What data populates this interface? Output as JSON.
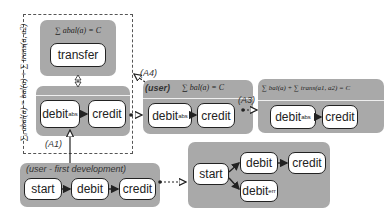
{
  "diagram": {
    "left_group": {
      "side_formula": "∑ₐ abal(a) = bal(a) + ∑ trans(a, a2)",
      "top_panel": {
        "formula": "∑ abal(a) = C",
        "node": "transfer"
      },
      "bottom_panel": {
        "nodes": [
          {
            "label": "debit",
            "sub": "abs"
          },
          {
            "label": "credit",
            "sub": ""
          }
        ]
      },
      "arrow_label": "(A1)"
    },
    "user_first_dev": {
      "title": "(user - first development)",
      "nodes": [
        "start",
        "debit",
        "credit"
      ]
    },
    "a2": {
      "label": "(A2)",
      "nodes": {
        "start": "start",
        "debit": "debit",
        "credit": "credit",
        "debit_err": "debit",
        "debit_err_sub": "err"
      }
    },
    "user": {
      "arrow_label": "(A4)",
      "title": "(user)",
      "formula": "∑ bal(a) = C",
      "nodes": [
        {
          "label": "debit",
          "sub": "abs"
        },
        {
          "label": "credit",
          "sub": ""
        }
      ]
    },
    "a3": {
      "arrow_label": "(A3)",
      "formula": "∑ bal(a) + ∑ trans(a1, a2) = C",
      "nodes": [
        {
          "label": "debit",
          "sub": "abs"
        },
        {
          "label": "credit",
          "sub": ""
        }
      ]
    }
  }
}
